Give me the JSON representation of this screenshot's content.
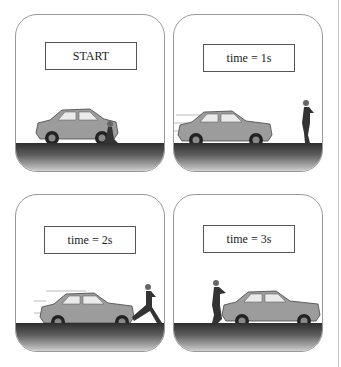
{
  "figure": {
    "colors": {
      "panel_border": "#9a9a9a",
      "car_body": "#9c9c9c",
      "ground_dark": "#2e2e2e",
      "label_border": "#555555"
    },
    "panels": [
      {
        "label": "START",
        "car": "parked facing right, stationary",
        "runner": "crouched in starting position behind car"
      },
      {
        "label": "time = 1s",
        "car": "moving left with motion lines",
        "runner": "running right, ahead of car"
      },
      {
        "label": "time = 2s",
        "car": "moving left with motion lines",
        "runner": "running left, kicking at car's front"
      },
      {
        "label": "time = 3s",
        "car": "facing right",
        "runner": "behind car on left, running"
      }
    ]
  }
}
